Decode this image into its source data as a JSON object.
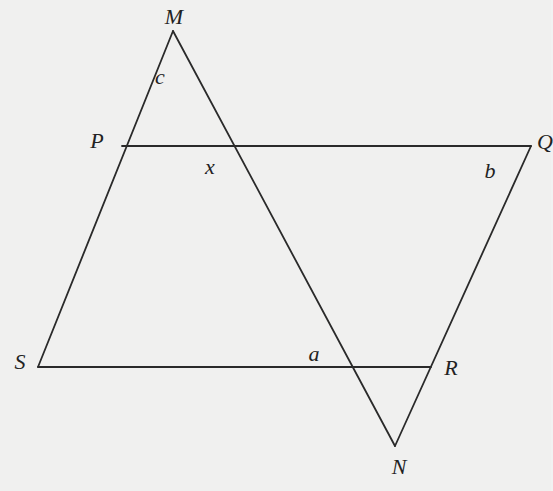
{
  "diagram": {
    "type": "geometry",
    "stroke_color": "#2a2a2a",
    "background": "#f0f0ef",
    "points": {
      "M": [
        173,
        31
      ],
      "P": [
        122,
        146
      ],
      "Q": [
        531,
        146
      ],
      "S": [
        38,
        367
      ],
      "R": [
        431,
        367
      ],
      "N": [
        395,
        446
      ]
    },
    "segments": [
      [
        "M",
        "S"
      ],
      [
        "M",
        "N"
      ],
      [
        "P",
        "Q"
      ],
      [
        "Q",
        "N"
      ],
      [
        "S",
        "R"
      ]
    ],
    "vertex_labels": [
      {
        "text": "M",
        "x": 174,
        "y": 17
      },
      {
        "text": "P",
        "x": 97,
        "y": 141
      },
      {
        "text": "Q",
        "x": 545,
        "y": 142
      },
      {
        "text": "S",
        "x": 20,
        "y": 362
      },
      {
        "text": "R",
        "x": 451,
        "y": 368
      },
      {
        "text": "N",
        "x": 399,
        "y": 467
      }
    ],
    "angle_labels": [
      {
        "text": "c",
        "x": 160,
        "y": 77
      },
      {
        "text": "x",
        "x": 210,
        "y": 167
      },
      {
        "text": "b",
        "x": 490,
        "y": 171
      },
      {
        "text": "a",
        "x": 314,
        "y": 354
      }
    ]
  }
}
